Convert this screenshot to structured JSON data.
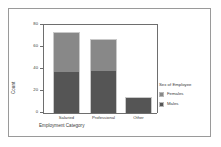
{
  "chart_data": {
    "type": "bar",
    "subtype": "stacked-bar",
    "title": "",
    "xlabel": "Employment Category",
    "ylabel": "Count",
    "categories": [
      "Salaried",
      "Professional",
      "Other"
    ],
    "series": [
      {
        "name": "Males",
        "values": [
          37,
          38,
          14
        ],
        "color": "#555555"
      },
      {
        "name": "Females",
        "values": [
          36,
          29,
          1
        ],
        "color": "#888888"
      }
    ],
    "totals": [
      73,
      67,
      15
    ],
    "ylim": [
      0,
      80
    ],
    "yticks": [
      0,
      20,
      40,
      60,
      80
    ],
    "ytick_labels": [
      "0",
      "20",
      "40",
      "60",
      "80"
    ],
    "grid": false,
    "legend": {
      "title": "Sex of Employee",
      "position": "right",
      "entries": [
        {
          "label": "Females",
          "color": "#888888"
        },
        {
          "label": "Males",
          "color": "#555555"
        }
      ]
    },
    "axis_color": "#6e6e6e",
    "frame_color": "#9a9a9a",
    "background": "#ffffff"
  }
}
